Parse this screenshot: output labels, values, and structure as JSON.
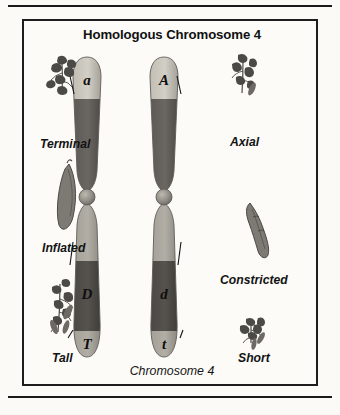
{
  "figure": {
    "title": "Homologous Chromosome 4",
    "footer": "Chromosome 4",
    "border_color": "#1d1d1d",
    "background_color": "#fcfbf8"
  },
  "chromosomes": [
    {
      "id": "left-chromosome",
      "side": "left",
      "alleles": [
        {
          "symbol": "a",
          "arm": "p",
          "trait": "Terminal",
          "dominance": "recessive"
        },
        {
          "symbol": "D",
          "arm": "q",
          "trait": "Inflated",
          "dominance": "dominant"
        },
        {
          "symbol": "T",
          "arm": "q",
          "trait": "Tall",
          "dominance": "dominant"
        }
      ]
    },
    {
      "id": "right-chromosome",
      "side": "right",
      "alleles": [
        {
          "symbol": "A",
          "arm": "p",
          "trait": "Axial",
          "dominance": "dominant"
        },
        {
          "symbol": "d",
          "arm": "q",
          "trait": "Constricted",
          "dominance": "recessive"
        },
        {
          "symbol": "t",
          "arm": "q",
          "trait": "Short",
          "dominance": "recessive"
        }
      ]
    }
  ],
  "trait_labels": {
    "left": [
      {
        "name": "terminal",
        "text": "Terminal",
        "icon": "flower-cluster-icon"
      },
      {
        "name": "inflated",
        "text": "Inflated",
        "icon": "pea-pod-icon"
      },
      {
        "name": "tall",
        "text": "Tall",
        "icon": "tall-plant-icon"
      }
    ],
    "right": [
      {
        "name": "axial",
        "text": "Axial",
        "icon": "flower-cluster-icon"
      },
      {
        "name": "constricted",
        "text": "Constricted",
        "icon": "constricted-pod-icon"
      },
      {
        "name": "short",
        "text": "Short",
        "icon": "short-plant-icon"
      }
    ]
  },
  "colors": {
    "band_light": "#b9b5ab",
    "band_mid": "#918d84",
    "band_dark": "#55524d",
    "band_darkest": "#3f3d39",
    "outline": "#6f6c66",
    "leader_line": "#141414",
    "plant_ink": "#4b4a46"
  }
}
